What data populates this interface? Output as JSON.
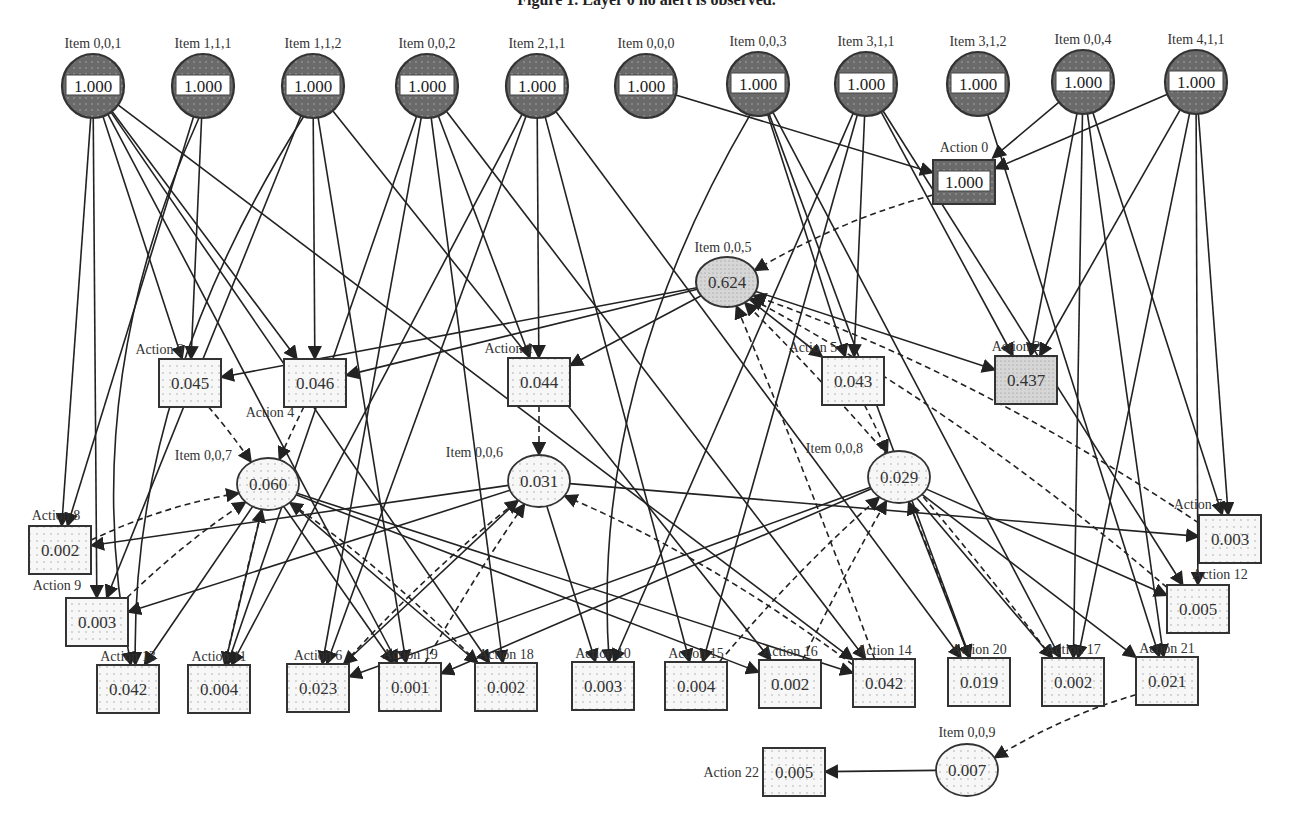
{
  "figure": {
    "title": "Figure 1. Layer 0 no alert is observed."
  },
  "colors": {
    "root_fill": "#6e6e6e",
    "edge": "#222222",
    "node_stroke": "#333333",
    "light_fill": "#f4f4f4",
    "mid_fill": "#cfcfcf"
  },
  "nodes": [
    {
      "id": "i001",
      "label": "Item 0,0,1",
      "value": "1.000",
      "shape": "root",
      "x": 93,
      "y": 86
    },
    {
      "id": "i111",
      "label": "Item 1,1,1",
      "value": "1.000",
      "shape": "root",
      "x": 203,
      "y": 86
    },
    {
      "id": "i112",
      "label": "Item 1,1,2",
      "value": "1.000",
      "shape": "root",
      "x": 313,
      "y": 86
    },
    {
      "id": "i002",
      "label": "Item 0,0,2",
      "value": "1.000",
      "shape": "root",
      "x": 427,
      "y": 86
    },
    {
      "id": "i211",
      "label": "Item 2,1,1",
      "value": "1.000",
      "shape": "root",
      "x": 537,
      "y": 86
    },
    {
      "id": "i000",
      "label": "Item 0,0,0",
      "value": "1.000",
      "shape": "root",
      "x": 646,
      "y": 86
    },
    {
      "id": "i003",
      "label": "Item 0,0,3",
      "value": "1.000",
      "shape": "root",
      "x": 758,
      "y": 84
    },
    {
      "id": "i311",
      "label": "Item 3,1,1",
      "value": "1.000",
      "shape": "root",
      "x": 866,
      "y": 84
    },
    {
      "id": "i312",
      "label": "Item 3,1,2",
      "value": "1.000",
      "shape": "root",
      "x": 978,
      "y": 84
    },
    {
      "id": "i004",
      "label": "Item 0,0,4",
      "value": "1.000",
      "shape": "root",
      "x": 1083,
      "y": 82
    },
    {
      "id": "i411",
      "label": "Item 4,1,1",
      "value": "1.000",
      "shape": "root",
      "x": 1196,
      "y": 82
    },
    {
      "id": "a0",
      "label": "Action 0",
      "value": "1.000",
      "shape": "rootbox",
      "x": 964,
      "y": 182
    },
    {
      "id": "i005",
      "label": "Item 0,0,5",
      "value": "0.624",
      "shape": "midellipse",
      "x": 727,
      "y": 282
    },
    {
      "id": "a3",
      "label": "Action 3",
      "value": "0.045",
      "shape": "box",
      "x": 190,
      "y": 383
    },
    {
      "id": "a4",
      "label": "Action 4",
      "value": "0.046",
      "shape": "box",
      "x": 315,
      "y": 383
    },
    {
      "id": "a1",
      "label": "Action 1",
      "value": "0.044",
      "shape": "box",
      "x": 539,
      "y": 382
    },
    {
      "id": "a5",
      "label": "Action 5",
      "value": "0.043",
      "shape": "box",
      "x": 853,
      "y": 381
    },
    {
      "id": "a2",
      "label": "Action 2",
      "value": "0.437",
      "shape": "midbox",
      "x": 1026,
      "y": 380
    },
    {
      "id": "i007",
      "label": "Item 0,0,7",
      "value": "0.060",
      "shape": "ellipse",
      "x": 268,
      "y": 484
    },
    {
      "id": "i006",
      "label": "Item 0,0,6",
      "value": "0.031",
      "shape": "ellipse",
      "x": 539,
      "y": 481
    },
    {
      "id": "i008",
      "label": "Item 0,0,8",
      "value": "0.029",
      "shape": "ellipse",
      "x": 899,
      "y": 477
    },
    {
      "id": "a8",
      "label": "Action 8",
      "value": "0.002",
      "shape": "box",
      "x": 60,
      "y": 550
    },
    {
      "id": "a7",
      "label": "Action 7",
      "value": "0.003",
      "shape": "box",
      "x": 1230,
      "y": 539
    },
    {
      "id": "a9",
      "label": "Action 9",
      "value": "0.003",
      "shape": "box",
      "x": 97,
      "y": 622
    },
    {
      "id": "a12",
      "label": "Action 12",
      "value": "0.005",
      "shape": "box",
      "x": 1198,
      "y": 609
    },
    {
      "id": "a13",
      "label": "Action 13",
      "value": "0.042",
      "shape": "box",
      "x": 128,
      "y": 689
    },
    {
      "id": "a11",
      "label": "Action 11",
      "value": "0.004",
      "shape": "box",
      "x": 219,
      "y": 689
    },
    {
      "id": "a6",
      "label": "Action 6",
      "value": "0.023",
      "shape": "box",
      "x": 318,
      "y": 688
    },
    {
      "id": "a19",
      "label": "Action 19",
      "value": "0.001",
      "shape": "box",
      "x": 410,
      "y": 687
    },
    {
      "id": "a18",
      "label": "Action 18",
      "value": "0.002",
      "shape": "box",
      "x": 506,
      "y": 687
    },
    {
      "id": "a10",
      "label": "Action 10",
      "value": "0.003",
      "shape": "box",
      "x": 603,
      "y": 686
    },
    {
      "id": "a15",
      "label": "Action 15",
      "value": "0.004",
      "shape": "box",
      "x": 696,
      "y": 686
    },
    {
      "id": "a16",
      "label": "Action 16",
      "value": "0.002",
      "shape": "box",
      "x": 790,
      "y": 684
    },
    {
      "id": "a14",
      "label": "Action 14",
      "value": "0.042",
      "shape": "box",
      "x": 884,
      "y": 683
    },
    {
      "id": "a20",
      "label": "Action 20",
      "value": "0.019",
      "shape": "box",
      "x": 979,
      "y": 682
    },
    {
      "id": "a17",
      "label": "Action 17",
      "value": "0.002",
      "shape": "box",
      "x": 1073,
      "y": 682
    },
    {
      "id": "a21",
      "label": "Action 21",
      "value": "0.021",
      "shape": "box",
      "x": 1167,
      "y": 681
    },
    {
      "id": "i009",
      "label": "Item 0,0,9",
      "value": "0.007",
      "shape": "ellipse",
      "x": 967,
      "y": 770
    },
    {
      "id": "a22",
      "label": "Action 22",
      "value": "0.005",
      "shape": "box",
      "x": 794,
      "y": 772
    }
  ],
  "edges": [
    [
      "i001",
      "a3",
      0
    ],
    [
      "i001",
      "a4",
      0
    ],
    [
      "i001",
      "a8",
      0
    ],
    [
      "i001",
      "a9",
      0
    ],
    [
      "i001",
      "a19",
      0
    ],
    [
      "i001",
      "a18",
      0
    ],
    [
      "i001",
      "a14",
      0
    ],
    [
      "i111",
      "a3",
      0
    ],
    [
      "i111",
      "a8",
      0
    ],
    [
      "i111",
      "a13",
      1
    ],
    [
      "i112",
      "a4",
      0
    ],
    [
      "i112",
      "a9",
      0
    ],
    [
      "i112",
      "a19",
      0
    ],
    [
      "i112",
      "a16",
      0
    ],
    [
      "i112",
      "a13",
      1
    ],
    [
      "i002",
      "a1",
      0
    ],
    [
      "i002",
      "a11",
      0
    ],
    [
      "i002",
      "a6",
      0
    ],
    [
      "i002",
      "a18",
      0
    ],
    [
      "i002",
      "a14",
      0
    ],
    [
      "i211",
      "a1",
      0
    ],
    [
      "i211",
      "a11",
      0
    ],
    [
      "i211",
      "a6",
      0
    ],
    [
      "i211",
      "a20",
      0
    ],
    [
      "i211",
      "a15",
      0
    ],
    [
      "i000",
      "a0",
      0
    ],
    [
      "i003",
      "a5",
      0
    ],
    [
      "i003",
      "a10",
      1
    ],
    [
      "i003",
      "a20",
      0
    ],
    [
      "i003",
      "a17",
      0
    ],
    [
      "i311",
      "a5",
      0
    ],
    [
      "i311",
      "a10",
      0
    ],
    [
      "i311",
      "a15",
      0
    ],
    [
      "i311",
      "a12",
      0
    ],
    [
      "i311",
      "a2",
      0
    ],
    [
      "i312",
      "a21",
      0
    ],
    [
      "i004",
      "a0",
      0
    ],
    [
      "i004",
      "a2",
      0
    ],
    [
      "i004",
      "a7",
      0
    ],
    [
      "i004",
      "a17",
      0
    ],
    [
      "i004",
      "a21",
      0
    ],
    [
      "i411",
      "a0",
      0
    ],
    [
      "i411",
      "a2",
      0
    ],
    [
      "i411",
      "a7",
      0
    ],
    [
      "i411",
      "a12",
      0
    ],
    [
      "i411",
      "a17",
      0
    ],
    [
      "i005",
      "a3",
      0
    ],
    [
      "i005",
      "a4",
      0
    ],
    [
      "i005",
      "a1",
      0
    ],
    [
      "i005",
      "a5",
      0
    ],
    [
      "i005",
      "a2",
      0
    ],
    [
      "i007",
      "a13",
      0
    ],
    [
      "i007",
      "a11",
      0
    ],
    [
      "i007",
      "a18",
      0
    ],
    [
      "i007",
      "a16",
      0
    ],
    [
      "i007",
      "a14",
      0
    ],
    [
      "i007",
      "a19",
      0
    ],
    [
      "i006",
      "a8",
      0
    ],
    [
      "i006",
      "a9",
      0
    ],
    [
      "i006",
      "a7",
      0
    ],
    [
      "i006",
      "a10",
      0
    ],
    [
      "i006",
      "a6",
      0
    ],
    [
      "i008",
      "a12",
      0
    ],
    [
      "i008",
      "a20",
      0
    ],
    [
      "i008",
      "a17",
      0
    ],
    [
      "i008",
      "a21",
      0
    ],
    [
      "i008",
      "a19",
      0
    ],
    [
      "i008",
      "a6",
      0
    ],
    [
      "i009",
      "a22",
      0
    ]
  ],
  "dashed_edges": [
    [
      "a0",
      "i005"
    ],
    [
      "a3",
      "i007"
    ],
    [
      "a4",
      "i007"
    ],
    [
      "a1",
      "i006"
    ],
    [
      "a5",
      "i008"
    ],
    [
      "a21",
      "i009"
    ],
    [
      "a8",
      "i007"
    ],
    [
      "a9",
      "i007"
    ],
    [
      "a11",
      "i007"
    ],
    [
      "a18",
      "i007"
    ],
    [
      "a6",
      "i006"
    ],
    [
      "a19",
      "i006"
    ],
    [
      "a14",
      "i006"
    ],
    [
      "a15",
      "i008"
    ],
    [
      "a16",
      "i008"
    ],
    [
      "a20",
      "i008"
    ],
    [
      "a12",
      "i005"
    ],
    [
      "a7",
      "i005"
    ],
    [
      "a17",
      "i005"
    ],
    [
      "a14",
      "i005"
    ]
  ]
}
